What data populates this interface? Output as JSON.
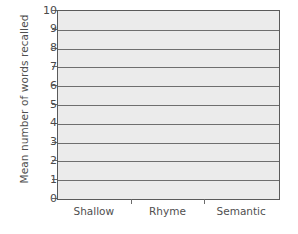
{
  "chart_data": {
    "type": "bar",
    "title": "",
    "subtitle": "",
    "xlabel": "",
    "ylabel": "Mean number of words recalled",
    "categories": [
      "Shallow",
      "Rhyme",
      "Semantic"
    ],
    "values": [
      null,
      null,
      null
    ],
    "series": [
      {
        "name": "Mean number of words recalled",
        "values": [
          null,
          null,
          null
        ]
      }
    ],
    "ylim": [
      0,
      10
    ],
    "ytick_labels": [
      "0",
      "1",
      "2",
      "3",
      "4",
      "5",
      "6",
      "7",
      "8",
      "9",
      "10"
    ],
    "ytick_values": [
      0,
      1,
      2,
      3,
      4,
      5,
      6,
      7,
      8,
      9,
      10
    ],
    "grid": true,
    "grid_axis": "y",
    "legend": false,
    "legend_position": "none",
    "annotations": [],
    "note": "Blank axes template: gridlines and labels only, no bars plotted.",
    "colors": {
      "plot_background": "#ebebeb",
      "figure_background": "#ffffff",
      "gridline": "#6e6e6e",
      "axis_line": "#5a5a5a",
      "tick_label": "#4a4a4a",
      "axis_title": "#4f4f4f"
    }
  }
}
